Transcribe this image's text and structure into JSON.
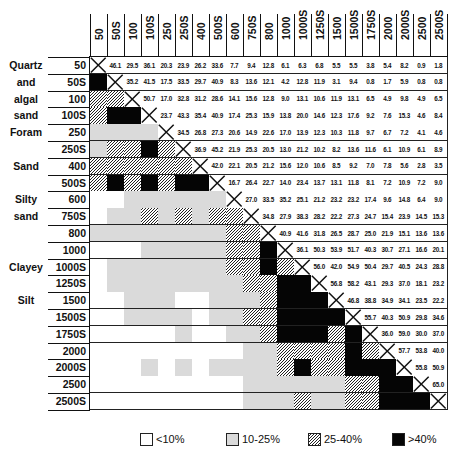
{
  "chart_data": {
    "type": "heatmap",
    "title": "",
    "labels": [
      "50",
      "50S",
      "100",
      "100S",
      "250",
      "250S",
      "400",
      "500S",
      "600",
      "750S",
      "800",
      "1000",
      "1000S",
      "1250S",
      "1500",
      "1500S",
      "1750S",
      "2000",
      "2000S",
      "2500",
      "2500S"
    ],
    "groups": [
      {
        "name": "Quartz",
        "row": 0
      },
      {
        "name": "and",
        "row": 1
      },
      {
        "name": "algal",
        "row": 2
      },
      {
        "name": "sand",
        "row": 3
      },
      {
        "name": "Foram",
        "row": 4
      },
      {
        "name": "Sand",
        "row": 6
      },
      {
        "name": "Silty",
        "row": 8
      },
      {
        "name": "sand",
        "row": 9
      },
      {
        "name": "Clayey",
        "row": 12
      },
      {
        "name": "Silt",
        "row": 14
      }
    ],
    "upper_values": [
      [
        46.1,
        29.5,
        36.1,
        20.3,
        23.9,
        26.2,
        33.6,
        7.7,
        9.4,
        12.8,
        6.1,
        6.3,
        6.8,
        5.5,
        5.5,
        3.8,
        5.4,
        8.2,
        0.9,
        1.8
      ],
      [
        35.2,
        41.5,
        17.5,
        33.5,
        29.7,
        40.9,
        8.3,
        13.6,
        12.1,
        4.2,
        12.8,
        11.9,
        3.1,
        9.4,
        0.8,
        1.7,
        5.9,
        0.8,
        0.8
      ],
      [
        50.7,
        17.0,
        32.8,
        31.2,
        28.6,
        14.1,
        15.6,
        12.8,
        9.0,
        13.1,
        10.6,
        11.9,
        13.1,
        6.5,
        4.9,
        9.8,
        4.9,
        6.5
      ],
      [
        23.7,
        43.3,
        35.4,
        40.9,
        17.4,
        25.3,
        15.9,
        13.8,
        20.0,
        14.6,
        12.3,
        17.6,
        9.2,
        7.6,
        15.3,
        4.6,
        8.4
      ],
      [
        34.5,
        26.8,
        27.3,
        20.6,
        14.9,
        22.6,
        17.0,
        13.9,
        12.3,
        10.3,
        11.8,
        9.7,
        6.7,
        7.2,
        4.1,
        4.6
      ],
      [
        36.9,
        45.2,
        21.9,
        25.3,
        20.5,
        13.0,
        21.2,
        10.2,
        8.2,
        13.6,
        11.6,
        6.1,
        10.9,
        6.1,
        8.9
      ],
      [
        42.0,
        22.1,
        20.5,
        21.2,
        15.6,
        12.0,
        10.6,
        8.5,
        9.2,
        7.0,
        7.8,
        5.6,
        2.8,
        3.5
      ],
      [
        16.7,
        26.4,
        22.7,
        14.0,
        23.4,
        13.7,
        13.1,
        11.8,
        8.1,
        7.2,
        10.9,
        7.2,
        9.0
      ],
      [
        27.0,
        33.5,
        35.2,
        25.1,
        21.2,
        23.2,
        23.2,
        17.4,
        9.6,
        14.8,
        6.4,
        9.0
      ],
      [
        34.8,
        27.9,
        38.3,
        28.2,
        22.2,
        27.3,
        24.7,
        15.4,
        23.9,
        14.5,
        15.3
      ],
      [
        40.9,
        41.6,
        31.8,
        26.5,
        28.7,
        25.0,
        21.9,
        15.1,
        13.6,
        13.6
      ],
      [
        36.1,
        50.3,
        53.9,
        51.7,
        40.3,
        30.7,
        27.1,
        16.6,
        20.1
      ],
      [
        56.0,
        42.0,
        54.9,
        50.4,
        29.7,
        40.5,
        24.3,
        28.8
      ],
      [
        56.8,
        58.2,
        43.1,
        29.3,
        37.0,
        18.1,
        23.2
      ],
      [
        46.8,
        38.8,
        34.9,
        34.1,
        23.5,
        22.2
      ],
      [
        55.7,
        40.3,
        50.9,
        29.8,
        34.6
      ],
      [
        36.0,
        59.0,
        30.0,
        37.0
      ],
      [
        57.7,
        53.8,
        40.0
      ],
      [
        55.8,
        50.9
      ],
      [
        65.0
      ],
      []
    ],
    "legend": [
      {
        "key": "w",
        "label": "<10%",
        "range": [
          0,
          10
        ]
      },
      {
        "key": "g",
        "label": "10-25%",
        "range": [
          10,
          25
        ]
      },
      {
        "key": "h",
        "label": "25-40%",
        "range": [
          25,
          40
        ]
      },
      {
        "key": "b",
        "label": ">40%",
        "range": [
          40,
          100
        ]
      }
    ],
    "diagonal": "X mark"
  }
}
